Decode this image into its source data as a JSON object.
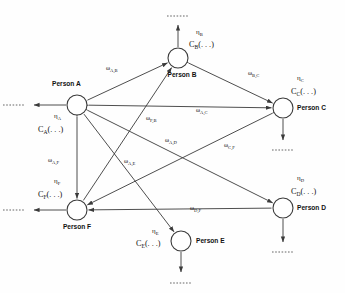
{
  "figure": {
    "type": "node-graph",
    "background": "#ffffff",
    "stroke_color": "#3a3a3a",
    "text_color": "#111111"
  },
  "nodes": [
    {
      "id": "A",
      "label": "Person A",
      "cx": 77,
      "cy": 105,
      "r": 10,
      "label_x": 52,
      "label_y": 86,
      "label_anchor": "start",
      "eta": "η",
      "eta_sub": "A",
      "eta_x": 54,
      "eta_y": 118,
      "cost": "C",
      "cost_sub": "A",
      "cost_args": "(. . .)",
      "cost_x": 38,
      "cost_y": 132,
      "out_dir": "left",
      "out_x2": 34,
      "out_y2": 105,
      "dots": ". . . . . .",
      "dots_x": 3,
      "dots_y": 107
    },
    {
      "id": "B",
      "label": "Person B",
      "cx": 178,
      "cy": 58,
      "r": 10,
      "label_x": 182,
      "label_y": 77,
      "label_anchor": "middle",
      "eta": "η",
      "eta_sub": "B",
      "eta_x": 196,
      "eta_y": 34,
      "cost": "C",
      "cost_sub": "B",
      "cost_args": "(. . .)",
      "cost_x": 189,
      "cost_y": 47,
      "out_dir": "up",
      "out_x2": 178,
      "out_y2": 25,
      "dots": ". . . . . .",
      "dots_x": 167,
      "dots_y": 18
    },
    {
      "id": "C",
      "label": "Person C",
      "cx": 283,
      "cy": 108,
      "r": 10,
      "label_x": 297,
      "label_y": 110,
      "label_anchor": "start",
      "eta": "η",
      "eta_sub": "C",
      "eta_x": 297,
      "eta_y": 80,
      "cost": "C",
      "cost_sub": "C",
      "cost_args": "(. . .)",
      "cost_x": 291,
      "cost_y": 94,
      "out_dir": "down",
      "out_x2": 283,
      "out_y2": 140,
      "dots": ". . . . . .",
      "dots_x": 272,
      "dots_y": 152
    },
    {
      "id": "D",
      "label": "Person D",
      "cx": 283,
      "cy": 208,
      "r": 10,
      "label_x": 297,
      "label_y": 210,
      "label_anchor": "start",
      "eta": "η",
      "eta_sub": "D",
      "eta_x": 297,
      "eta_y": 180,
      "cost": "C",
      "cost_sub": "D",
      "cost_args": "(. . .)",
      "cost_x": 291,
      "cost_y": 194,
      "out_dir": "down",
      "out_x2": 283,
      "out_y2": 242,
      "dots": ". . . . . .",
      "dots_x": 272,
      "dots_y": 254
    },
    {
      "id": "E",
      "label": "Person E",
      "cx": 181,
      "cy": 241,
      "r": 10,
      "label_x": 196,
      "label_y": 243,
      "label_anchor": "start",
      "eta": "η",
      "eta_sub": "E",
      "eta_x": 152,
      "eta_y": 233,
      "cost": "C",
      "cost_sub": "E",
      "cost_args": "(. . .)",
      "cost_x": 136,
      "cost_y": 246,
      "out_dir": "down",
      "out_x2": 181,
      "out_y2": 272,
      "dots": ". . . . . .",
      "dots_x": 170,
      "dots_y": 285
    },
    {
      "id": "F",
      "label": "Person F",
      "cx": 77,
      "cy": 210,
      "r": 10,
      "label_x": 77,
      "label_y": 229,
      "label_anchor": "middle",
      "eta": "η",
      "eta_sub": "F",
      "eta_x": 54,
      "eta_y": 183,
      "cost": "C",
      "cost_sub": "F",
      "cost_args": "(. . .)",
      "cost_x": 38,
      "cost_y": 197,
      "out_dir": "left",
      "out_x2": 34,
      "out_y2": 210,
      "dots": ". . . . . .",
      "dots_x": 3,
      "dots_y": 212
    }
  ],
  "edges": [
    {
      "id": "A-B",
      "from": "A",
      "to": "B",
      "arrow": "to",
      "omega": "ω",
      "omega_sub": "A,B",
      "label_x": 106,
      "label_y": 70
    },
    {
      "id": "B-C",
      "from": "B",
      "to": "C",
      "arrow": "both",
      "omega": "ω",
      "omega_sub": "B,C",
      "label_x": 248,
      "label_y": 75
    },
    {
      "id": "A-C",
      "from": "A",
      "to": "C",
      "arrow": "both",
      "omega": "ω",
      "omega_sub": "A,C",
      "label_x": 196,
      "label_y": 112
    },
    {
      "id": "F-B",
      "from": "F",
      "to": "B",
      "arrow": "to",
      "omega": "ω",
      "omega_sub": "F,B",
      "label_x": 146,
      "label_y": 120
    },
    {
      "id": "A-D",
      "from": "A",
      "to": "D",
      "arrow": "both",
      "omega": "ω",
      "omega_sub": "A,D",
      "label_x": 165,
      "label_y": 142
    },
    {
      "id": "C-F",
      "from": "C",
      "to": "F",
      "arrow": "both",
      "omega": "ω",
      "omega_sub": "C,F",
      "label_x": 224,
      "label_y": 147
    },
    {
      "id": "A-F",
      "from": "A",
      "to": "F",
      "arrow": "both",
      "omega": "ω",
      "omega_sub": "A,F",
      "label_x": 48,
      "label_y": 162
    },
    {
      "id": "A-E",
      "from": "A",
      "to": "E",
      "arrow": "to",
      "omega": "ω",
      "omega_sub": "A,E",
      "label_x": 124,
      "label_y": 163
    },
    {
      "id": "D-F",
      "from": "D",
      "to": "F",
      "arrow": "to",
      "omega": "ω",
      "omega_sub": "D,F",
      "label_x": 190,
      "label_y": 210
    }
  ]
}
